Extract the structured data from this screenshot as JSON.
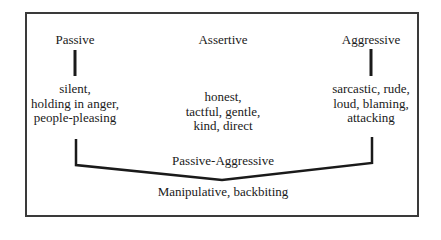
{
  "diagram": {
    "columns": [
      {
        "heading": "Passive",
        "traits": [
          "silent,",
          "holding in anger,",
          "people-pleasing"
        ]
      },
      {
        "heading": "Assertive",
        "traits": [
          "honest,",
          "tactful, gentle,",
          "kind, direct"
        ]
      },
      {
        "heading": "Aggressive",
        "traits": [
          "sarcastic, rude,",
          "loud, blaming,",
          "attacking"
        ]
      }
    ],
    "combined": {
      "heading": "Passive-Aggressive",
      "traits": "Manipulative, backbiting"
    },
    "colors": {
      "line": "#1a1a1a",
      "border": "#3a3a3a",
      "background": "#ffffff"
    }
  }
}
